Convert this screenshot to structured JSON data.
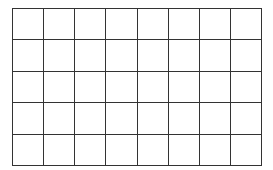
{
  "grid": {
    "rows": 5,
    "columns": 8,
    "line_color": "#333333",
    "background": "#ffffff"
  }
}
